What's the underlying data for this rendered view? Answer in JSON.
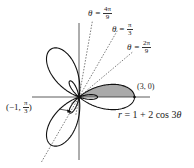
{
  "diagram": {
    "equation": {
      "lhs": "r",
      "rhs": "= 1 + 2 cos 3",
      "theta": "θ"
    },
    "curve": {
      "a": 1,
      "b": 2,
      "k": 3
    },
    "rays": [
      {
        "prefix": "θ =",
        "num": "4π",
        "den": "9",
        "angle_deg": 80
      },
      {
        "prefix": "θ =",
        "num": "π",
        "den": "3",
        "angle_deg": 60
      },
      {
        "prefix": "θ =",
        "num": "2π",
        "den": "9",
        "angle_deg": 40
      }
    ],
    "points": [
      {
        "label": "(3, 0)"
      },
      {
        "label_pre": "(−1,",
        "num": "π",
        "den": "3",
        "label_post": ")"
      }
    ],
    "shaded_region": {
      "from_deg": 0,
      "to_deg": 40,
      "color": "#aaaaaa"
    },
    "colors": {
      "curve": "#111111",
      "axis": "#333333",
      "ray": "#444444",
      "shade": "#aaaaaa"
    }
  }
}
